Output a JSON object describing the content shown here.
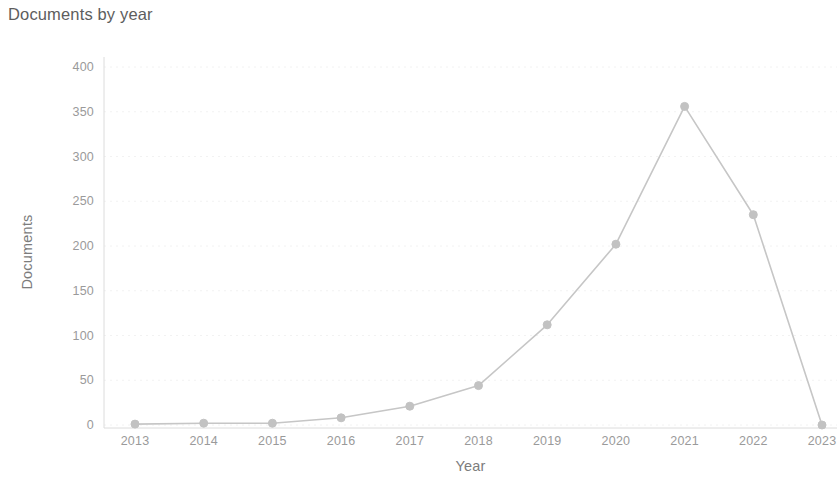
{
  "chart_data": {
    "type": "line",
    "title": "Documents by year",
    "xlabel": "Year",
    "ylabel": "Documents",
    "categories": [
      "2013",
      "2014",
      "2015",
      "2016",
      "2017",
      "2018",
      "2019",
      "2020",
      "2021",
      "2022",
      "2023"
    ],
    "values": [
      1,
      2,
      2,
      8,
      21,
      44,
      112,
      202,
      356,
      235,
      0
    ],
    "series": [
      {
        "name": "Documents",
        "values": [
          1,
          2,
          2,
          8,
          21,
          44,
          112,
          202,
          356,
          235,
          0
        ]
      }
    ],
    "ylim": [
      0,
      400
    ],
    "y_ticks": [
      0,
      50,
      100,
      150,
      200,
      250,
      300,
      350,
      400
    ],
    "y_tick_labels": [
      "0",
      "50",
      "100",
      "150",
      "200",
      "250",
      "300",
      "350",
      "400"
    ],
    "x_tick_labels": [
      "2013",
      "2014",
      "2015",
      "2016",
      "2017",
      "2018",
      "2019",
      "2020",
      "2021",
      "2022",
      "2023"
    ],
    "grid": true,
    "legend": false,
    "line_color": "#c6c6c6",
    "marker_color": "#c2c2c2",
    "grid_color": "#f2f2f2",
    "axis_color": "#dcdcdc",
    "background": "#ffffff"
  }
}
